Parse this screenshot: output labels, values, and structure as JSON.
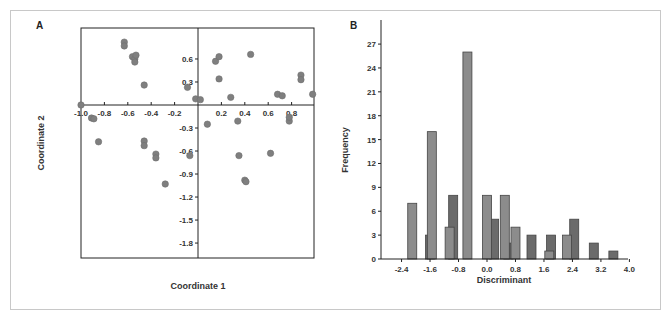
{
  "chart_data": [
    {
      "panel": "A",
      "type": "scatter",
      "title": "",
      "xlabel": "Coordinate 1",
      "ylabel": "Coordinate 2",
      "xlim": [
        -1.0,
        1.0
      ],
      "ylim": [
        -2.0,
        1.0
      ],
      "x_ticks": [
        "-1.0",
        "-0.8",
        "-0.6",
        "-0.4",
        "-0.2",
        "0.2",
        "0.4",
        "0.6",
        "0.8"
      ],
      "y_ticks": [
        "0.6",
        "0.3",
        "-0.3",
        "-0.6",
        "-0.9",
        "-1.2",
        "-1.5",
        "-1.8"
      ],
      "grid": false,
      "marker_color": "#7f7f7f",
      "points": [
        [
          -1.0,
          0.0
        ],
        [
          -0.91,
          -0.17
        ],
        [
          -0.89,
          -0.18
        ],
        [
          -0.85,
          -0.48
        ],
        [
          -0.63,
          0.82
        ],
        [
          -0.63,
          0.77
        ],
        [
          -0.56,
          0.63
        ],
        [
          -0.54,
          0.6
        ],
        [
          -0.53,
          0.65
        ],
        [
          -0.54,
          0.56
        ],
        [
          -0.46,
          0.26
        ],
        [
          -0.46,
          -0.47
        ],
        [
          -0.46,
          -0.53
        ],
        [
          -0.36,
          -0.64
        ],
        [
          -0.36,
          -0.69
        ],
        [
          -0.28,
          -1.03
        ],
        [
          -0.09,
          0.23
        ],
        [
          -0.07,
          -0.66
        ],
        [
          -0.02,
          0.08
        ],
        [
          0.02,
          0.07
        ],
        [
          0.08,
          -0.25
        ],
        [
          0.15,
          0.57
        ],
        [
          0.18,
          0.63
        ],
        [
          0.18,
          0.34
        ],
        [
          0.28,
          0.1
        ],
        [
          0.34,
          -0.21
        ],
        [
          0.35,
          -0.66
        ],
        [
          0.4,
          -0.98
        ],
        [
          0.41,
          -1.0
        ],
        [
          0.45,
          0.66
        ],
        [
          0.68,
          0.14
        ],
        [
          0.72,
          0.12
        ],
        [
          0.78,
          -0.21
        ],
        [
          0.78,
          -0.16
        ],
        [
          0.62,
          -0.63
        ],
        [
          0.88,
          0.39
        ],
        [
          0.88,
          0.33
        ],
        [
          0.98,
          0.14
        ]
      ]
    },
    {
      "panel": "B",
      "type": "bar",
      "title": "",
      "xlabel": "Discriminant",
      "ylabel": "Frequency",
      "xlim": [
        -2.95,
        4.0
      ],
      "ylim": [
        0,
        29
      ],
      "x_ticks": [
        "-2.4",
        "-1.6",
        "-0.8",
        "0.0",
        "0.8",
        "1.6",
        "2.4",
        "3.2",
        "4.0"
      ],
      "y_ticks": [
        "0",
        "3",
        "6",
        "9",
        "12",
        "15",
        "18",
        "21",
        "24",
        "27"
      ],
      "grid": false,
      "series": [
        {
          "name": "Group 1",
          "color": "#6b6b6b",
          "bars": [
            {
              "x": -1.6,
              "value": 3
            },
            {
              "x": -0.95,
              "value": 8
            },
            {
              "x": 0.2,
              "value": 5
            },
            {
              "x": 0.6,
              "value": 2
            },
            {
              "x": 1.25,
              "value": 3
            },
            {
              "x": 1.8,
              "value": 3
            },
            {
              "x": 2.45,
              "value": 5
            },
            {
              "x": 3.0,
              "value": 2
            },
            {
              "x": 3.55,
              "value": 1
            }
          ]
        },
        {
          "name": "Group 2",
          "color": "#8c8c8c",
          "bars": [
            {
              "x": -2.1,
              "value": 7
            },
            {
              "x": -1.55,
              "value": 16
            },
            {
              "x": -1.05,
              "value": 4
            },
            {
              "x": -0.55,
              "value": 26
            },
            {
              "x": 0.0,
              "value": 8
            },
            {
              "x": 0.5,
              "value": 8
            },
            {
              "x": 0.8,
              "value": 4
            },
            {
              "x": 1.75,
              "value": 1
            },
            {
              "x": 2.25,
              "value": 3
            }
          ]
        }
      ]
    }
  ],
  "labels": {
    "panel_a": "A",
    "panel_b": "B",
    "a_xlabel": "Coordinate 1",
    "a_ylabel": "Coordinate 2",
    "b_xlabel": "Discriminant",
    "b_ylabel": "Frequency"
  }
}
